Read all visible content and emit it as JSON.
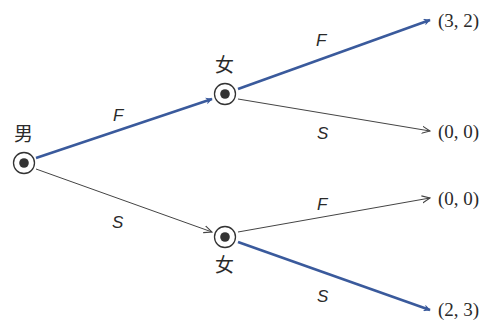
{
  "colors": {
    "equilibrium_path": "#3a5a9c",
    "other_path": "#444444",
    "node": "#333333",
    "text": "#2a2a2a",
    "background": "#ffffff"
  },
  "nodes": {
    "root": {
      "player": "男",
      "x": 24,
      "y": 163
    },
    "upper": {
      "player": "女",
      "x": 225,
      "y": 94
    },
    "lower": {
      "player": "女",
      "x": 225,
      "y": 237
    }
  },
  "edges": {
    "root_F": {
      "label": "F",
      "highlighted": true
    },
    "root_S": {
      "label": "S",
      "highlighted": false
    },
    "upper_F": {
      "label": "F",
      "highlighted": true
    },
    "upper_S": {
      "label": "S",
      "highlighted": false
    },
    "lower_F": {
      "label": "F",
      "highlighted": false
    },
    "lower_S": {
      "label": "S",
      "highlighted": true
    }
  },
  "payoffs": {
    "FF": "(3, 2)",
    "FS": "(0, 0)",
    "SF": "(0, 0)",
    "SS": "(2, 3)"
  }
}
